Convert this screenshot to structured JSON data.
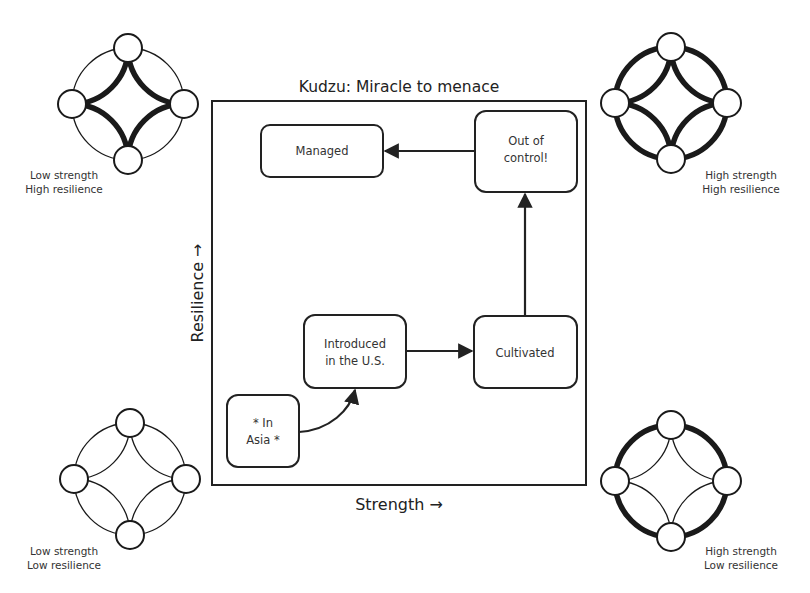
{
  "title": "Kudzu: Miracle to menace",
  "axes": {
    "x_label": "Strength →",
    "y_label": "Resilience →"
  },
  "nodes": [
    {
      "id": "in_asia",
      "lines": [
        "* In",
        "Asia *"
      ]
    },
    {
      "id": "introduced",
      "lines": [
        "Introduced",
        "in the U.S."
      ]
    },
    {
      "id": "cultivated",
      "lines": [
        "Cultivated"
      ]
    },
    {
      "id": "out_of_control",
      "lines": [
        "Out of",
        "control!"
      ]
    },
    {
      "id": "managed",
      "lines": [
        "Managed"
      ]
    }
  ],
  "edges": [
    {
      "from": "in_asia",
      "to": "introduced",
      "style": "curved"
    },
    {
      "from": "introduced",
      "to": "cultivated",
      "style": "straight"
    },
    {
      "from": "cultivated",
      "to": "out_of_control",
      "style": "straight"
    },
    {
      "from": "out_of_control",
      "to": "managed",
      "style": "straight"
    }
  ],
  "corner_graphs": [
    {
      "id": "low_strength_high_resilience",
      "position": "top-left",
      "label_lines": [
        "Low strength",
        "High resilience"
      ],
      "outer_ring": "thin",
      "inner_star": "thick"
    },
    {
      "id": "high_strength_high_resilience",
      "position": "top-right",
      "label_lines": [
        "High strength",
        "High resilience"
      ],
      "outer_ring": "thick",
      "inner_star": "thick"
    },
    {
      "id": "low_strength_low_resilience",
      "position": "bottom-left",
      "label_lines": [
        "Low strength",
        "Low resilience"
      ],
      "outer_ring": "thin",
      "inner_star": "thin"
    },
    {
      "id": "high_strength_low_resilience",
      "position": "bottom-right",
      "label_lines": [
        "High strength",
        "Low resilience"
      ],
      "outer_ring": "thick",
      "inner_star": "thin"
    }
  ]
}
